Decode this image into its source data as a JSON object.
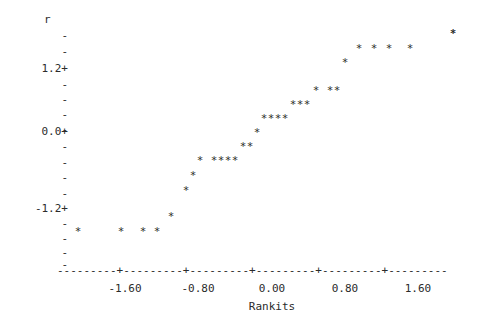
{
  "chart_data": {
    "type": "scatter",
    "title": "",
    "xlabel": "Rankits",
    "ylabel": "r",
    "marker": "*",
    "xlim": [
      -2.1,
      2.1
    ],
    "ylim": [
      -1.95,
      1.85
    ],
    "grid": false,
    "legend": null,
    "xticks": [
      -1.6,
      -0.8,
      0.0,
      0.8,
      1.6
    ],
    "xtick_labels": [
      "-1.60",
      "-0.80",
      "0.00",
      "0.80",
      "1.60"
    ],
    "yticks": [
      1.2,
      0.0,
      -1.2
    ],
    "ytick_labels": [
      "1.2+",
      "0.0+",
      "-1.2+"
    ],
    "y_minor_tick_glyph": "-",
    "y_major_tick_glyph": "+",
    "x_axis_line": "---------+---------+---------+---------+---------+---------",
    "n_points": 36,
    "points": [
      {
        "x": -1.92,
        "y": -1.53
      },
      {
        "x": -1.49,
        "y": -1.53
      },
      {
        "x": -1.27,
        "y": -1.53
      },
      {
        "x": -1.13,
        "y": -1.53
      },
      {
        "x": -1.0,
        "y": -1.41
      },
      {
        "x": -0.86,
        "y": -1.24
      },
      {
        "x": -0.8,
        "y": -1.11
      },
      {
        "x": -0.73,
        "y": -1.0
      },
      {
        "x": -0.59,
        "y": -1.0
      },
      {
        "x": -0.53,
        "y": -1.0
      },
      {
        "x": -0.48,
        "y": -1.0
      },
      {
        "x": -0.42,
        "y": -1.0
      },
      {
        "x": -0.37,
        "y": -0.9
      },
      {
        "x": -0.31,
        "y": -0.9
      },
      {
        "x": -0.26,
        "y": -0.79
      },
      {
        "x": -0.2,
        "y": -0.69
      },
      {
        "x": -0.15,
        "y": -0.69
      },
      {
        "x": -0.09,
        "y": -0.69
      },
      {
        "x": -0.04,
        "y": -0.69
      },
      {
        "x": 0.02,
        "y": -0.56
      },
      {
        "x": 0.08,
        "y": -0.56
      },
      {
        "x": 0.13,
        "y": -0.56
      },
      {
        "x": 0.23,
        "y": -0.46
      },
      {
        "x": 0.33,
        "y": -0.46
      },
      {
        "x": 0.38,
        "y": -0.46
      },
      {
        "x": 0.45,
        "y": -0.28
      },
      {
        "x": 0.59,
        "y": -0.11
      },
      {
        "x": 0.69,
        "y": -0.11
      },
      {
        "x": 0.75,
        "y": -0.11
      },
      {
        "x": 0.85,
        "y": -0.11
      },
      {
        "x": 1.0,
        "y": 0.05
      },
      {
        "x": 1.56,
        "y": 0.05
      }
    ],
    "point_pixels": [
      {
        "px": 78,
        "py": 231
      },
      {
        "px": 121,
        "py": 231
      },
      {
        "px": 143,
        "py": 231
      },
      {
        "px": 157,
        "py": 231
      },
      {
        "px": 171,
        "py": 216
      },
      {
        "px": 186,
        "py": 190
      },
      {
        "px": 193,
        "py": 175
      },
      {
        "px": 200,
        "py": 160
      },
      {
        "px": 214,
        "py": 160
      },
      {
        "px": 221,
        "py": 160
      },
      {
        "px": 228,
        "py": 160
      },
      {
        "px": 235,
        "py": 160
      },
      {
        "px": 243,
        "py": 146
      },
      {
        "px": 250,
        "py": 146
      },
      {
        "px": 257,
        "py": 132
      },
      {
        "px": 264,
        "py": 118
      },
      {
        "px": 271,
        "py": 118
      },
      {
        "px": 278,
        "py": 118
      },
      {
        "px": 285,
        "py": 118
      },
      {
        "px": 293,
        "py": 104
      },
      {
        "px": 300,
        "py": 104
      },
      {
        "px": 307,
        "py": 104
      },
      {
        "px": 316,
        "py": 90
      },
      {
        "px": 330,
        "py": 90
      },
      {
        "px": 337,
        "py": 90
      },
      {
        "px": 345,
        "py": 62
      },
      {
        "px": 359,
        "py": 48
      },
      {
        "px": 374,
        "py": 48
      },
      {
        "px": 389,
        "py": 48
      },
      {
        "px": 410,
        "py": 48
      },
      {
        "px": 453,
        "py": 33
      },
      {
        "px": 453,
        "py": 33
      }
    ]
  },
  "axes": {
    "y_title": "r",
    "y_rows": [
      {
        "glyph": "-",
        "py": 35
      },
      {
        "glyph": "-",
        "py": 51
      },
      {
        "glyph": "1.2+",
        "py": 68
      },
      {
        "glyph": "-",
        "py": 84
      },
      {
        "glyph": "-",
        "py": 99
      },
      {
        "glyph": "-",
        "py": 114
      },
      {
        "glyph": "-",
        "py": 129
      },
      {
        "glyph": "0.0+",
        "py": 131
      },
      {
        "glyph": "-",
        "py": 146
      },
      {
        "glyph": "-",
        "py": 162
      },
      {
        "glyph": "-",
        "py": 177
      },
      {
        "glyph": "-",
        "py": 193
      },
      {
        "glyph": "-1.2+",
        "py": 208
      },
      {
        "glyph": "-",
        "py": 223
      },
      {
        "glyph": "-",
        "py": 238
      },
      {
        "glyph": "-",
        "py": 252
      },
      {
        "glyph": "-",
        "py": 264
      }
    ],
    "x_tick_px": [
      125,
      198,
      272,
      345,
      418
    ]
  }
}
